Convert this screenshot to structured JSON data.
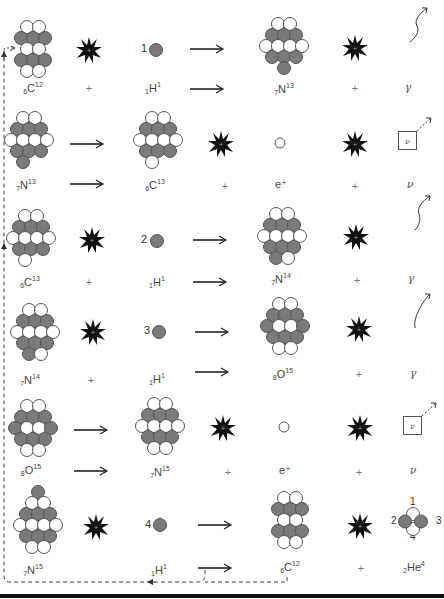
{
  "diagram": {
    "colors": {
      "proton": "#7a7a7a",
      "neutron": "#ffffff",
      "outline": "#555555",
      "burst": "#111111",
      "arrow": "#222222",
      "dashed": "#444444",
      "bottom_bar": "#111111"
    },
    "rows": [
      {
        "step": 1,
        "reactant": {
          "z": "6",
          "symbol": "C",
          "a": "12"
        },
        "plus1": "+",
        "projectile": {
          "number": "1",
          "z": "1",
          "symbol": "H",
          "a": "1"
        },
        "product": {
          "z": "7",
          "symbol": "N",
          "a": "13"
        },
        "plus2": "+",
        "emission": {
          "type": "gamma",
          "label": "γ",
          "icon": "gamma-ray-wavy-arrow-icon"
        }
      },
      {
        "step": 2,
        "reactant": {
          "z": "7",
          "symbol": "N",
          "a": "13"
        },
        "product": {
          "z": "6",
          "symbol": "C",
          "a": "13"
        },
        "plus1": "+",
        "particle": {
          "label": "e⁺",
          "icon": "positron-circle-icon"
        },
        "plus2": "+",
        "emission": {
          "type": "neutrino",
          "label": "ν",
          "box_label": "ν",
          "icon": "neutrino-box-icon"
        }
      },
      {
        "step": 3,
        "reactant": {
          "z": "6",
          "symbol": "C",
          "a": "13"
        },
        "plus1": "+",
        "projectile": {
          "number": "2",
          "z": "1",
          "symbol": "H",
          "a": "1"
        },
        "product": {
          "z": "7",
          "symbol": "N",
          "a": "14"
        },
        "plus2": "+",
        "emission": {
          "type": "gamma",
          "label": "γ",
          "icon": "gamma-ray-wavy-arrow-icon"
        }
      },
      {
        "step": 4,
        "reactant": {
          "z": "7",
          "symbol": "N",
          "a": "14"
        },
        "plus1": "+",
        "projectile": {
          "number": "3",
          "z": "1",
          "symbol": "H",
          "a": "1"
        },
        "product": {
          "z": "8",
          "symbol": "O",
          "a": "15"
        },
        "plus2": "+",
        "emission": {
          "type": "gamma",
          "label": "γ",
          "icon": "gamma-ray-wavy-arrow-icon"
        }
      },
      {
        "step": 5,
        "reactant": {
          "z": "8",
          "symbol": "O",
          "a": "15"
        },
        "product": {
          "z": "7",
          "symbol": "N",
          "a": "15"
        },
        "plus1": "+",
        "particle": {
          "label": "e⁺",
          "icon": "positron-circle-icon"
        },
        "plus2": "+",
        "emission": {
          "type": "neutrino",
          "label": "ν",
          "box_label": "ν",
          "icon": "neutrino-box-icon"
        }
      },
      {
        "step": 6,
        "reactant": {
          "z": "7",
          "symbol": "N",
          "a": "15"
        },
        "projectile": {
          "number": "4",
          "z": "1",
          "symbol": "H",
          "a": "1"
        },
        "product": {
          "z": "6",
          "symbol": "C",
          "a": "12"
        },
        "plus2": "+",
        "emission": {
          "type": "alpha",
          "z": "2",
          "symbol": "He",
          "a": "4",
          "nucleon_numbers": [
            "1",
            "2",
            "3",
            "4"
          ]
        }
      }
    ]
  }
}
